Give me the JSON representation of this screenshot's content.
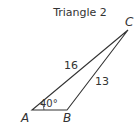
{
  "title": "Triangle 2",
  "vertices": {
    "A": {
      "label": "A",
      "x": 32,
      "y": 110
    },
    "B": {
      "label": "B",
      "x": 67,
      "y": 110
    },
    "C": {
      "label": "C",
      "x": 128,
      "y": 30
    }
  },
  "sides": {
    "AC": "16",
    "BC": "13"
  },
  "angles": {
    "A": "40°"
  },
  "colors": {
    "stroke": "#333333",
    "text": "#333333"
  }
}
